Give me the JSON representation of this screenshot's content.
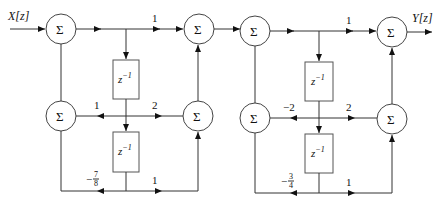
{
  "diagram": {
    "type": "signal-flow block diagram (cascade of two second-order sections)",
    "input_label": "X[z]",
    "output_label": "Y[z]",
    "summer_symbol": "Σ",
    "delay_label_base": "z",
    "delay_label_exp": "−1",
    "stage1": {
      "forward_gain_top": "1",
      "feedback_gain_mid": "1",
      "forward_gain_mid": "2",
      "feedback_gain_bottom_sign": "−",
      "feedback_gain_bottom_num": "7",
      "feedback_gain_bottom_den": "8",
      "forward_gain_bottom": "1"
    },
    "stage2": {
      "forward_gain_top": "1",
      "feedback_gain_mid": "−2",
      "forward_gain_mid": "2",
      "feedback_gain_bottom_sign": "−",
      "feedback_gain_bottom_num": "3",
      "feedback_gain_bottom_den": "4",
      "forward_gain_bottom": "1"
    }
  }
}
